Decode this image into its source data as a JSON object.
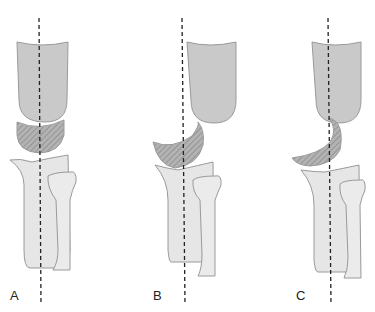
{
  "figure": {
    "panels": [
      {
        "label": "A",
        "description": "Upper bone aligned over lower bones; hatched bone centered on axis"
      },
      {
        "label": "B",
        "description": "Hatched bone tilted, upper bone shifted right"
      },
      {
        "label": "C",
        "description": "Hatched bone rotated further, displaced from axis"
      }
    ],
    "colors": {
      "upper_bone": "#c9c9c9",
      "hatched_bone": "#a8a8a8",
      "lower_bone": "#e6e6e6",
      "outline": "#9a9a9a",
      "axis_line": "#222222"
    }
  }
}
